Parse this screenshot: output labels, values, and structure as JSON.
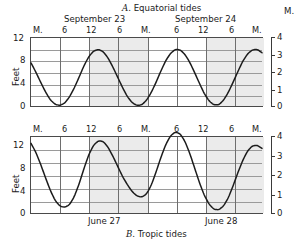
{
  "figure": {
    "panel_a_caption": "A.",
    "panel_a_caption_rest": "Equatorial tides",
    "panel_b_caption": "B.",
    "panel_b_caption_rest": "Tropic tides",
    "meters_header": "M."
  },
  "chart_data": [
    {
      "type": "line",
      "title": "A. Equatorial tides",
      "id": "equatorial",
      "xlabel": "",
      "ylabel": "Feet",
      "y2label": "M.",
      "ylim": [
        0,
        12
      ],
      "y2lim": [
        0,
        4
      ],
      "yticks": [
        0,
        4,
        8,
        12
      ],
      "y2ticks": [
        0,
        1,
        2,
        3,
        4
      ],
      "gridlines_y": [
        0,
        2,
        4,
        6,
        8,
        10,
        12
      ],
      "grid": true,
      "legend": "none",
      "day_labels": [
        "September  23",
        "September  24"
      ],
      "time_ticks": [
        "M.",
        "6",
        "12",
        "6",
        "M.",
        "6",
        "12",
        "6",
        "M."
      ],
      "x_hours": [
        0,
        6,
        12,
        18,
        24,
        30,
        36,
        42,
        48
      ],
      "xlim": [
        0,
        48
      ],
      "shaded_bands_hours": [
        [
          12,
          24
        ],
        [
          36,
          48
        ]
      ],
      "description": "Semidiurnal tide with nearly equal successive highs and lows",
      "x": [
        0,
        1,
        2,
        3,
        4,
        5,
        6,
        7,
        8,
        9,
        10,
        11,
        12,
        13,
        14,
        15,
        16,
        17,
        18,
        19,
        20,
        21,
        22,
        23,
        24,
        25,
        26,
        27,
        28,
        29,
        30,
        31,
        32,
        33,
        34,
        35,
        36,
        37,
        38,
        39,
        40,
        41,
        42,
        43,
        44,
        45,
        46,
        47,
        48
      ],
      "values": [
        7.6,
        6.0,
        4.2,
        2.5,
        1.1,
        0.3,
        0.1,
        0.5,
        1.6,
        3.2,
        5.1,
        7.1,
        8.7,
        9.7,
        10.0,
        9.6,
        8.5,
        6.9,
        5.1,
        3.3,
        1.7,
        0.6,
        0.1,
        0.2,
        1.0,
        2.4,
        4.2,
        6.2,
        8.0,
        9.3,
        10.0,
        9.9,
        9.1,
        7.7,
        5.9,
        4.0,
        2.2,
        0.9,
        0.2,
        0.2,
        1.0,
        2.4,
        4.2,
        6.1,
        7.9,
        9.2,
        9.9,
        10.0,
        9.4
      ]
    },
    {
      "type": "line",
      "title": "B. Tropic tides",
      "id": "tropic",
      "xlabel": "",
      "ylabel": "Feet",
      "y2label": "M.",
      "ylim": [
        0,
        12
      ],
      "y2lim": [
        0,
        4
      ],
      "yticks": [
        0,
        4,
        8,
        12
      ],
      "y2ticks": [
        0,
        1,
        2,
        3,
        4
      ],
      "gridlines_y": [
        0,
        2,
        4,
        6,
        8,
        10,
        12
      ],
      "grid": true,
      "legend": "none",
      "day_labels": [
        "June 27",
        "June 28"
      ],
      "time_ticks": [
        "M.",
        "6",
        "12",
        "6",
        "M.",
        "6",
        "12",
        "6",
        "M."
      ],
      "x_hours": [
        0,
        6,
        12,
        18,
        24,
        30,
        36,
        42,
        48
      ],
      "xlim": [
        0,
        48
      ],
      "shaded_bands_hours": [
        [
          12,
          24
        ],
        [
          36,
          48
        ]
      ],
      "description": "Mixed tide with marked diurnal inequality; alternating higher and lower highs and lows",
      "x": [
        0,
        1,
        2,
        3,
        4,
        5,
        6,
        7,
        8,
        9,
        10,
        11,
        12,
        13,
        14,
        15,
        16,
        17,
        18,
        19,
        20,
        21,
        22,
        23,
        24,
        25,
        26,
        27,
        28,
        29,
        30,
        31,
        32,
        33,
        34,
        35,
        36,
        37,
        38,
        39,
        40,
        41,
        42,
        43,
        44,
        45,
        46,
        47,
        48
      ],
      "values": [
        11.0,
        9.6,
        7.7,
        5.6,
        3.6,
        2.0,
        1.1,
        0.9,
        1.3,
        2.6,
        4.6,
        7.0,
        9.2,
        10.7,
        11.4,
        11.3,
        10.4,
        9.0,
        7.4,
        5.8,
        4.5,
        3.4,
        2.7,
        2.5,
        3.0,
        4.4,
        6.5,
        8.8,
        10.8,
        12.2,
        12.8,
        12.5,
        11.3,
        9.4,
        7.1,
        4.8,
        2.8,
        1.4,
        0.6,
        0.5,
        1.1,
        2.4,
        4.3,
        6.4,
        8.3,
        9.8,
        10.6,
        10.7,
        10.2
      ]
    }
  ]
}
